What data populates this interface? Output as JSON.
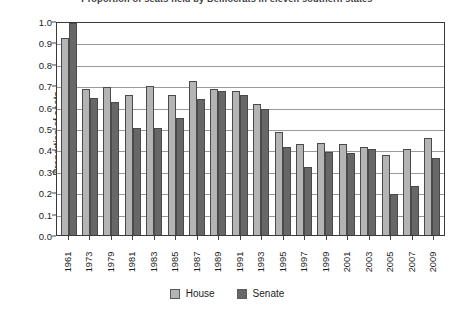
{
  "chart_data": {
    "type": "bar",
    "title": "Proportion of seats held by Democrats in eleven southern states",
    "xlabel": "",
    "ylabel": "Proportion of seats",
    "ylim": [
      0.0,
      1.0
    ],
    "ytick_labels": [
      "1.0",
      "0.9",
      "0.8",
      "0.7",
      "0.6",
      "0.5",
      "0.4",
      "0.3",
      "0.2",
      "0.1",
      "0.0"
    ],
    "ytick_values": [
      1.0,
      0.9,
      0.8,
      0.7,
      0.6,
      0.5,
      0.4,
      0.3,
      0.2,
      0.1,
      0.0
    ],
    "grid": true,
    "grid_axis": "y",
    "legend_position": "bottom-center",
    "categories": [
      "1961",
      "1973",
      "1979",
      "1981",
      "1983",
      "1985",
      "1987",
      "1989",
      "1991",
      "1993",
      "1995",
      "1997",
      "1999",
      "2001",
      "2003",
      "2005",
      "2007",
      "2009"
    ],
    "series": [
      {
        "name": "House",
        "color": "#b4b4b4",
        "values": [
          0.92,
          0.68,
          0.69,
          0.655,
          0.695,
          0.655,
          0.72,
          0.68,
          0.675,
          0.61,
          0.48,
          0.425,
          0.43,
          0.425,
          0.41,
          0.375,
          0.4,
          0.455
        ]
      },
      {
        "name": "Senate",
        "color": "#676767",
        "values": [
          0.99,
          0.64,
          0.62,
          0.5,
          0.5,
          0.545,
          0.635,
          0.675,
          0.655,
          0.59,
          0.41,
          0.32,
          0.39,
          0.385,
          0.4,
          0.19,
          0.23,
          0.36
        ]
      }
    ]
  },
  "legend": {
    "items": [
      {
        "label": "House",
        "swatch": "house-swatch"
      },
      {
        "label": "Senate",
        "swatch": "senate-swatch"
      }
    ]
  }
}
